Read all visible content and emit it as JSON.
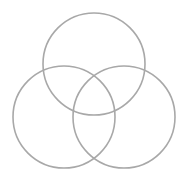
{
  "diagram": {
    "type": "venn",
    "stroke_color": "#a8a8a8",
    "stroke_width": 1.6,
    "fill": "none",
    "circles": [
      {
        "name": "top",
        "cx": 94,
        "cy": 64,
        "r": 51
      },
      {
        "name": "left",
        "cx": 64,
        "cy": 117,
        "r": 51
      },
      {
        "name": "right",
        "cx": 124,
        "cy": 117,
        "r": 51
      }
    ]
  }
}
